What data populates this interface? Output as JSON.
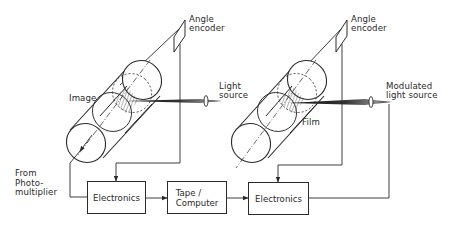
{
  "diagram": {
    "type": "block-and-schematic",
    "left_system": {
      "encoder_label": "Angle\nencoder",
      "cylinder_label": "Image",
      "light_label": "Light\nsource",
      "input_label": "From\nPhoto-\nmultiplier",
      "electronics_label": "Electronics"
    },
    "middle": {
      "storage_label": "Tape /\nComputer"
    },
    "right_system": {
      "encoder_label": "Angle\nencoder",
      "cylinder_label": "Film",
      "light_label": "Modulated\nlight source",
      "electronics_label": "Electronics"
    },
    "colors": {
      "line": "#2a2a2a",
      "background": "#ffffff"
    }
  }
}
